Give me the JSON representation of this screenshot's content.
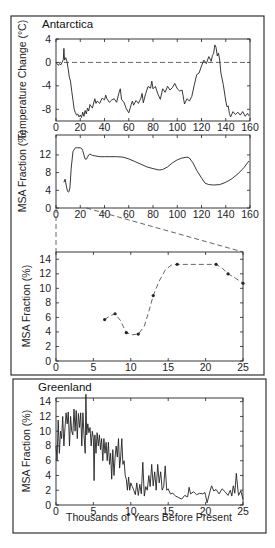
{
  "chart_data": [
    {
      "id": "antarctica-temp",
      "panel": "Antarctica",
      "title": "Antarctica",
      "type": "line",
      "xlabel": "",
      "ylabel": "Temperature Change (°C)",
      "xlim": [
        0,
        160
      ],
      "ylim": [
        -10,
        4
      ],
      "xticks": [
        0,
        20,
        40,
        60,
        80,
        100,
        120,
        140,
        160
      ],
      "yticks": [
        4,
        0,
        -4,
        -8
      ],
      "reference_line": {
        "y": 0,
        "style": "dashed"
      },
      "series": [
        {
          "name": "Temperature Change",
          "x": [
            0,
            2,
            3,
            4,
            5,
            6,
            6.5,
            7,
            8,
            9,
            10,
            11,
            12,
            13,
            14,
            15,
            16,
            17,
            18,
            19,
            20,
            21,
            22,
            23,
            24,
            25,
            26,
            27,
            28,
            30,
            32,
            33,
            34,
            36,
            38,
            40,
            41,
            42,
            44,
            46,
            48,
            50,
            52,
            53,
            54,
            56,
            58,
            60,
            62,
            63,
            64,
            66,
            68,
            70,
            71,
            72,
            74,
            76,
            78,
            79,
            80,
            82,
            84,
            86,
            88,
            90,
            92,
            94,
            96,
            98,
            100,
            102,
            104,
            106,
            108,
            110,
            112,
            114,
            116,
            118,
            120,
            122,
            124,
            126,
            128,
            129,
            130,
            131,
            132,
            133,
            134,
            135,
            136,
            138,
            140,
            141,
            142,
            143,
            144,
            146,
            148,
            150,
            152,
            154,
            156,
            158,
            159
          ],
          "y": [
            0,
            -0.5,
            -0.2,
            -0.4,
            0,
            0.5,
            2.4,
            0.4,
            0.8,
            0.2,
            -1,
            -2.5,
            -3.2,
            -5,
            -6.5,
            -8,
            -8.6,
            -9,
            -8.8,
            -9.3,
            -9,
            -9.4,
            -8.5,
            -9.2,
            -8.2,
            -8.8,
            -7.8,
            -8.3,
            -7.2,
            -7.8,
            -6.2,
            -7,
            -6.6,
            -7,
            -6.1,
            -6.4,
            -5.6,
            -6.2,
            -6.8,
            -6.4,
            -6.2,
            -6.8,
            -5.1,
            -4.5,
            -6.3,
            -6.8,
            -7.9,
            -8.6,
            -7.2,
            -6.6,
            -7.3,
            -6.5,
            -7,
            -6.1,
            -5.3,
            -6.9,
            -5.3,
            -4.1,
            -4.4,
            -3.2,
            -4.5,
            -4.1,
            -5.4,
            -6.3,
            -4.5,
            -5.1,
            -4.1,
            -4.7,
            -4.3,
            -3.6,
            -4.5,
            -4.9,
            -4.7,
            -7.1,
            -6.2,
            -6.6,
            -5.8,
            -3.9,
            -2.1,
            -1.8,
            -0.6,
            0.4,
            -0.2,
            1,
            0.2,
            1.2,
            1.5,
            3,
            2.6,
            1.1,
            1.6,
            0.4,
            -1.8,
            -3.8,
            -6.6,
            -7.6,
            -7.4,
            -8.7,
            -9.3,
            -8.4,
            -8.9,
            -8.5,
            -9,
            -8.4,
            -9.2,
            -8.7,
            -9.1
          ]
        }
      ]
    },
    {
      "id": "antarctica-msa-160",
      "panel": "Antarctica",
      "type": "line",
      "xlabel": "",
      "ylabel": "MSA Fraction (%)",
      "xlim": [
        0,
        160
      ],
      "ylim": [
        0,
        16.5
      ],
      "xticks": [
        0,
        20,
        40,
        60,
        80,
        100,
        120,
        140,
        160
      ],
      "yticks": [
        12,
        8,
        4,
        0
      ],
      "series": [
        {
          "name": "MSA Fraction",
          "x": [
            6.5,
            7.5,
            8.5,
            9.5,
            10.5,
            11.5,
            12.5,
            14,
            16,
            18,
            20,
            21,
            22,
            23,
            24,
            25,
            26,
            27,
            28,
            30,
            32,
            36,
            40,
            50,
            55,
            60,
            65,
            70,
            75,
            80,
            85,
            88,
            92,
            96,
            100,
            104,
            108,
            110,
            113,
            116,
            120,
            123,
            126,
            130,
            135,
            140,
            145,
            150,
            155,
            159
          ],
          "y": [
            5.8,
            6.5,
            5,
            3.8,
            3.6,
            4.5,
            9,
            12.8,
            13.6,
            13.6,
            13.6,
            13.5,
            13,
            12,
            11.1,
            11,
            11.5,
            12,
            12.2,
            11.9,
            11.8,
            11.6,
            11.6,
            11.6,
            11.5,
            11.1,
            10.5,
            9.9,
            9.3,
            8.9,
            8.6,
            8.7,
            9.3,
            10.2,
            10.9,
            11.3,
            11.5,
            11.3,
            10.2,
            8.5,
            6.8,
            5.6,
            5.3,
            5.2,
            5.3,
            5.8,
            6.6,
            7.7,
            9.1,
            10.6
          ]
        }
      ],
      "zoom_indicator": {
        "from_x": [
          0,
          25
        ],
        "to_plot": "antarctica-msa-25"
      }
    },
    {
      "id": "antarctica-msa-25",
      "panel": "Antarctica",
      "type": "line",
      "xlabel": "",
      "ylabel": "MSA Fraction (%)",
      "xlim": [
        0,
        25
      ],
      "ylim": [
        0,
        15
      ],
      "xticks": [
        0,
        5,
        10,
        15,
        20,
        25
      ],
      "yticks": [
        14,
        12,
        10,
        8,
        6,
        4,
        2,
        0
      ],
      "line_style": "dashed",
      "series": [
        {
          "name": "MSA Fraction (0-25 kyr)",
          "markers": {
            "x": [
              6.5,
              7.9,
              9.4,
              11.0,
              13.0,
              16.2,
              21.4,
              23.0,
              25.0
            ],
            "y": [
              5.7,
              6.5,
              3.9,
              3.7,
              9.0,
              13.3,
              13.3,
              12.0,
              10.7
            ]
          },
          "x": [
            6.5,
            7.2,
            7.9,
            8.6,
            9.4,
            10.2,
            11.0,
            11.8,
            12.4,
            13.0,
            13.8,
            14.6,
            15.4,
            16.2,
            18,
            20,
            21.4,
            22.2,
            23.0,
            24,
            25.0
          ],
          "y": [
            5.7,
            6.2,
            6.5,
            5.6,
            3.9,
            3.6,
            3.7,
            4.8,
            6.8,
            9.0,
            11.0,
            12.5,
            13.2,
            13.3,
            13.3,
            13.3,
            13.3,
            12.8,
            12.0,
            11.4,
            10.7
          ]
        }
      ]
    },
    {
      "id": "greenland-msa",
      "panel": "Greenland",
      "title": "Greenland",
      "type": "line",
      "xlabel": "Thousands of Years Before Present",
      "ylabel": "MSA Fraction (%)",
      "xlim": [
        0,
        25
      ],
      "ylim": [
        0,
        14.5
      ],
      "xticks": [
        0,
        5,
        10,
        15,
        20,
        25
      ],
      "yticks": [
        14,
        12,
        10,
        8,
        6,
        4,
        2,
        0
      ],
      "series": [
        {
          "name": "MSA Fraction",
          "x": [
            0,
            0.15,
            0.3,
            0.45,
            0.6,
            0.75,
            0.9,
            1.05,
            1.2,
            1.35,
            1.5,
            1.65,
            1.8,
            1.95,
            2.1,
            2.25,
            2.4,
            2.55,
            2.7,
            2.85,
            3,
            3.15,
            3.3,
            3.45,
            3.6,
            3.75,
            3.9,
            4.0,
            4.1,
            4.25,
            4.4,
            4.55,
            4.7,
            4.85,
            5,
            5.1,
            5.2,
            5.35,
            5.5,
            5.65,
            5.8,
            5.95,
            6.1,
            6.25,
            6.4,
            6.55,
            6.7,
            6.85,
            7,
            7.15,
            7.3,
            7.45,
            7.6,
            7.75,
            7.9,
            8.05,
            8.2,
            8.35,
            8.5,
            8.65,
            8.8,
            8.95,
            9.1,
            9.25,
            9.4,
            9.55,
            9.7,
            9.85,
            10,
            10.2,
            10.4,
            10.6,
            10.8,
            11,
            11.2,
            11.4,
            11.6,
            11.8,
            12,
            12.2,
            12.4,
            12.6,
            12.8,
            13,
            13.2,
            13.4,
            13.6,
            13.8,
            14,
            14.2,
            14.4,
            14.6,
            14.8,
            15,
            15.3,
            15.6,
            16,
            16.4,
            16.8,
            17.2,
            17.6,
            17.8,
            18,
            18.4,
            18.8,
            19.2,
            19.6,
            19.9,
            20,
            20.2,
            20.5,
            20.8,
            21.1,
            21.4,
            21.8,
            22.2,
            22.6,
            23,
            23.3,
            23.5,
            23.7,
            23.9,
            24.1,
            24.4,
            24.7,
            25
          ],
          "y": [
            8,
            6,
            11.5,
            7,
            10,
            9,
            12,
            8,
            10.5,
            12.5,
            11,
            12.6,
            8,
            12,
            10,
            9.5,
            13,
            10,
            12.8,
            9,
            12.4,
            10.5,
            12.5,
            8,
            12.5,
            9.5,
            7,
            15,
            9.5,
            11,
            9.8,
            10.5,
            8,
            10,
            9,
            3.3,
            9.5,
            7,
            9.8,
            8,
            9.5,
            7.5,
            9,
            6,
            9,
            7,
            8.5,
            6,
            8.5,
            5.5,
            7,
            3.5,
            7.5,
            4,
            6.5,
            8,
            6.5,
            9,
            5,
            6.5,
            9,
            5.5,
            6,
            4,
            3.5,
            2,
            3.8,
            2,
            3,
            2.5,
            2,
            1.4,
            3,
            1.3,
            2.8,
            1.5,
            5.8,
            1.2,
            2.5,
            2,
            4,
            2.5,
            5.5,
            2.6,
            4.5,
            2,
            5.5,
            3,
            4.5,
            2,
            2.5,
            5.3,
            2,
            2.2,
            1.5,
            1.6,
            1.2,
            1.0,
            0.8,
            1.3,
            1.1,
            2.4,
            1.5,
            1.8,
            1.4,
            1.6,
            1.5,
            1.7,
            1.3,
            0.3,
            1.5,
            2.6,
            1.9,
            2.1,
            1.5,
            2.2,
            1.8,
            1.3,
            2.0,
            1.2,
            2.6,
            1.6,
            4.3,
            1.3,
            1.9,
            0.8,
            1.2,
            1.2
          ]
        }
      ]
    }
  ],
  "panels": {
    "antarctica": {
      "title": "Antarctica"
    },
    "greenland": {
      "title": "Greenland",
      "xlabel": "Thousands of Years Before Present"
    }
  },
  "colors": {
    "line": "#222222",
    "frame": "#222222",
    "background": "#ffffff",
    "dash": "#555555"
  }
}
